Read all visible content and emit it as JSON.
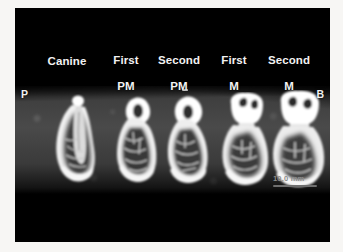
{
  "figure": {
    "modality": "CBCT cross-sectional slices",
    "panel_background": "#000000",
    "page_background": "#f7f6f4"
  },
  "column_labels": [
    {
      "id": "canine",
      "text": "Canine",
      "lines": [
        "Canine"
      ],
      "x": 44,
      "y": 55
    },
    {
      "id": "first-pm",
      "text": "First PM",
      "lines": [
        "First",
        "PM"
      ],
      "x": 100,
      "y": 38
    },
    {
      "id": "second-pm",
      "text": "Second PM",
      "lines": [
        "Second",
        "PM"
      ],
      "x": 152,
      "y": 38
    },
    {
      "id": "first-m",
      "text": "First M",
      "lines": [
        "First",
        "M"
      ],
      "x": 212,
      "y": 38
    },
    {
      "id": "second-m",
      "text": "Second M",
      "lines": [
        "Second",
        "M"
      ],
      "x": 262,
      "y": 38
    }
  ],
  "orientation_markers": [
    {
      "id": "palatal",
      "label": "P",
      "x": 21,
      "y": 88
    },
    {
      "id": "buccal",
      "label": "B",
      "x": 312,
      "y": 88
    }
  ],
  "scale_bar": {
    "label": "10.0 mm",
    "x": 274,
    "y": 176,
    "width": 44,
    "color": "#8d8d8d"
  },
  "teeth": [
    {
      "id": "canine-slice",
      "label": "Canine",
      "x": 28,
      "y": 86
    },
    {
      "id": "first-pm-slice",
      "label": "First PM",
      "x": 94,
      "y": 86
    },
    {
      "id": "second-pm-slice",
      "label": "Second PM",
      "x": 145,
      "y": 86
    },
    {
      "id": "first-m-slice",
      "label": "First M",
      "x": 200,
      "y": 84
    },
    {
      "id": "second-m-slice",
      "label": "Second M",
      "x": 252,
      "y": 82
    }
  ]
}
